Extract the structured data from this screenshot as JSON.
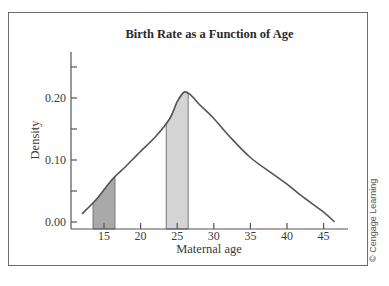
{
  "chart_data": {
    "type": "area",
    "title": "Birth Rate as a Function of Age",
    "xlabel": "Maternal age",
    "ylabel": "Density",
    "xlim": [
      11.5,
      48
    ],
    "ylim": [
      0.0,
      0.27
    ],
    "x_ticks": [
      15,
      20,
      25,
      30,
      35,
      40,
      45
    ],
    "y_ticks": [
      0.0,
      0.05,
      0.1,
      0.15,
      0.2,
      0.25
    ],
    "y_tick_labels": [
      "0.00",
      "",
      "0.10",
      "",
      "0.20",
      ""
    ],
    "grid": false,
    "legend": null,
    "series": [
      {
        "name": "Density of maternal age",
        "x": [
          12,
          14,
          16,
          18,
          20,
          22,
          24,
          25,
          26,
          27,
          28,
          30,
          32,
          35,
          38,
          40,
          42,
          45,
          46.5
        ],
        "values": [
          0.013,
          0.037,
          0.067,
          0.09,
          0.114,
          0.137,
          0.167,
          0.194,
          0.21,
          0.203,
          0.19,
          0.167,
          0.14,
          0.104,
          0.078,
          0.061,
          0.042,
          0.016,
          0.0
        ]
      }
    ],
    "shaded_regions": [
      {
        "x_from": 13.5,
        "x_to": 16.5,
        "color": "#a9a9a9",
        "label": "ages 13.5–16.5"
      },
      {
        "x_from": 23.5,
        "x_to": 26.5,
        "color": "#d4d4d4",
        "label": "ages 23.5–26.5"
      }
    ]
  },
  "credit": "© Cengage Learning",
  "colors": {
    "curve": "#555555",
    "axis": "#555555",
    "dark_shade": "#a9a9a9",
    "light_shade": "#d4d4d4",
    "frame": "#6e6e6e"
  }
}
